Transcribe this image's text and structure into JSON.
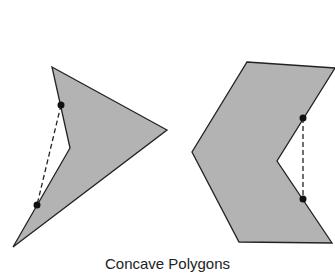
{
  "caption": "Concave Polygons",
  "colors": {
    "fill": "#b3b3b3",
    "stroke": "#222222",
    "dot": "#111111"
  },
  "polygons": [
    {
      "name": "concave-arrowhead",
      "points": "52,67 167,130 13,247 70,148",
      "segment": {
        "x1": 61,
        "y1": 105,
        "x2": 37,
        "y2": 205
      }
    },
    {
      "name": "concave-chevron",
      "points": "247,62 335,68 277,161 332,243 239,242 192,152",
      "segment": {
        "x1": 303,
        "y1": 118,
        "x2": 303,
        "y2": 199
      }
    }
  ]
}
